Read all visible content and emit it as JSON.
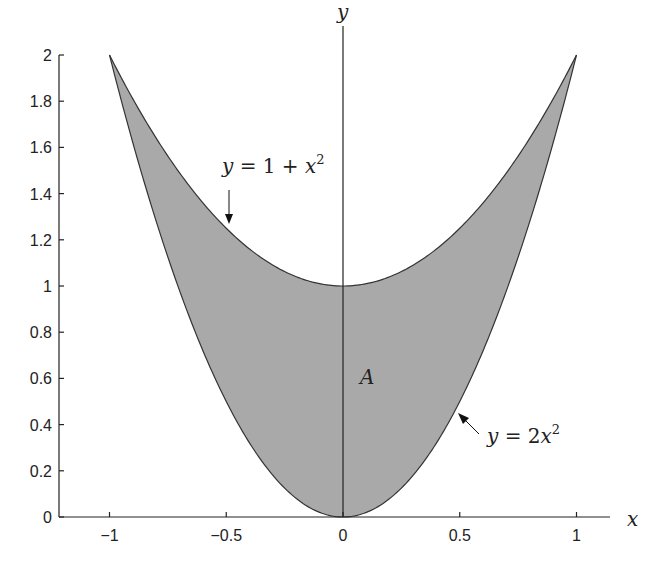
{
  "chart_data": {
    "type": "area",
    "title": "",
    "xlabel": "x",
    "ylabel": "y",
    "xlim": [
      -1.25,
      1.25
    ],
    "ylim": [
      0,
      2
    ],
    "grid": false,
    "x_ticks": [
      -1,
      -0.5,
      0,
      0.5,
      1
    ],
    "x_tick_labels": [
      "−1",
      "−0.5",
      "0",
      "0.5",
      "1"
    ],
    "y_ticks": [
      0,
      0.2,
      0.4,
      0.6,
      0.8,
      1,
      1.2,
      1.4,
      1.6,
      1.8,
      2
    ],
    "y_tick_labels": [
      "0",
      "0.2",
      "0.4",
      "0.6",
      "0.8",
      "1",
      "1.2",
      "1.4",
      "1.6",
      "1.8",
      "2"
    ],
    "series": [
      {
        "name": "y = 1 + x^2",
        "function": "1 + x^2",
        "x": [
          -1,
          -0.75,
          -0.5,
          -0.25,
          0,
          0.25,
          0.5,
          0.75,
          1
        ],
        "y": [
          2,
          1.5625,
          1.25,
          1.0625,
          1,
          1.0625,
          1.25,
          1.5625,
          2
        ]
      },
      {
        "name": "y = 2x^2",
        "function": "2*x^2",
        "x": [
          -1,
          -0.75,
          -0.5,
          -0.25,
          0,
          0.25,
          0.5,
          0.75,
          1
        ],
        "y": [
          2,
          1.125,
          0.5,
          0.125,
          0,
          0.125,
          0.5,
          1.125,
          2
        ]
      }
    ],
    "shaded_region": {
      "label": "A",
      "between": [
        "y = 2x^2",
        "y = 1 + x^2"
      ],
      "x_range": [
        -1,
        1
      ],
      "color": "#a9a9a9"
    },
    "annotations": [
      {
        "text_parts": [
          "y",
          " = 1 + ",
          "x",
          "2"
        ],
        "arrow_to": [
          -0.5,
          1.25
        ]
      },
      {
        "text_parts": [
          "y",
          " = 2",
          "x",
          "2"
        ],
        "arrow_to": [
          0.5,
          0.5
        ]
      },
      {
        "text": "A",
        "at": [
          0.1,
          0.62
        ]
      }
    ]
  },
  "labels": {
    "x_axis": "x",
    "y_axis": "y",
    "region": "A",
    "upper_curve": {
      "y": "y",
      "eq": " = 1 + ",
      "x": "x",
      "exp": "2"
    },
    "lower_curve": {
      "y": "y",
      "eq": " = 2",
      "x": "x",
      "exp": "2"
    }
  },
  "colors": {
    "fill": "#a9a9a9",
    "line": "#333333",
    "axis": "#222222"
  }
}
